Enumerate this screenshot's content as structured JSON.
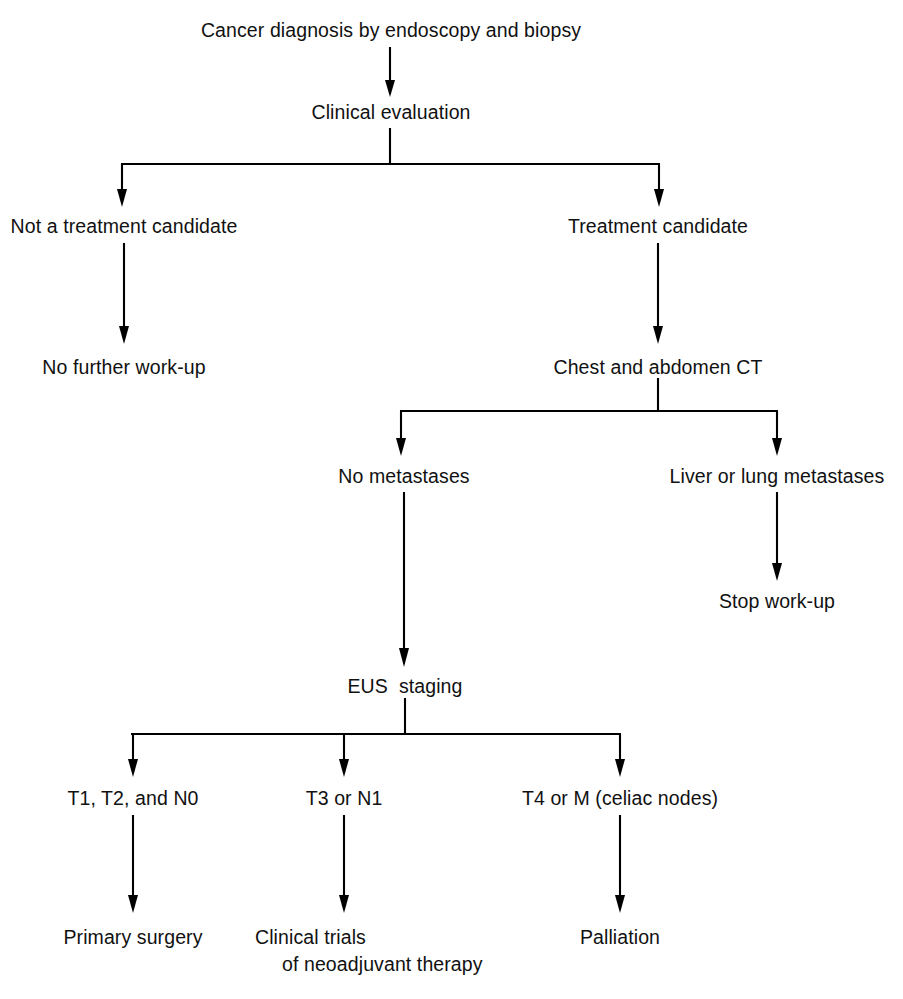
{
  "diagram": {
    "title": "Cancer diagnosis by endoscopy and biopsy",
    "type": "flowchart",
    "orientation": "top-to-bottom",
    "background_color": "#ffffff",
    "line_color": "#000000",
    "text_color": "#111111",
    "nodes": {
      "start": "Cancer diagnosis by endoscopy and biopsy",
      "clinical_evaluation": "Clinical evaluation",
      "not_candidate": "Not a treatment candidate",
      "no_further_workup": "No further work-up",
      "treatment_candidate": "Treatment candidate",
      "chest_abdomen_ct": "Chest and abdomen CT",
      "no_metastases": "No metastases",
      "liver_lung_metastases": "Liver or lung metastases",
      "stop_workup": "Stop work-up",
      "eus_staging": "EUS  staging",
      "stage_t1_t2_n0": "T1, T2, and N0",
      "stage_t3_n1": "T3 or N1",
      "stage_t4_m": "T4 or M (celiac nodes)",
      "primary_surgery": "Primary surgery",
      "clinical_trials_line1": "Clinical trials",
      "clinical_trials_line2": "of neoadjuvant therapy",
      "palliation": "Palliation"
    }
  }
}
